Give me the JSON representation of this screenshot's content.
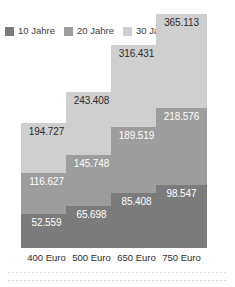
{
  "legend": {
    "items": [
      {
        "label": "10 Jahre",
        "color": "#7b7b7b"
      },
      {
        "label": "20 Jahre",
        "color": "#9d9d9d"
      },
      {
        "label": "30 Jahre",
        "color": "#cfcfcf"
      }
    ]
  },
  "chart_data": {
    "type": "bar",
    "stacked": true,
    "title": "",
    "subtitle": "",
    "xlabel": "",
    "ylabel": "",
    "grid": false,
    "legend_position": "top-left",
    "categories": [
      "400 Euro",
      "500 Euro",
      "650 Euro",
      "750 Euro"
    ],
    "series": [
      {
        "name": "10 Jahre",
        "color": "#7b7b7b",
        "values": [
          52559,
          65698,
          85408,
          98547
        ]
      },
      {
        "name": "20 Jahre",
        "color": "#9d9d9d",
        "values": [
          116627,
          145748,
          189519,
          218576
        ]
      },
      {
        "name": "30 Jahre",
        "color": "#cfcfcf",
        "values": [
          194727,
          243408,
          316431,
          365113
        ]
      }
    ],
    "value_labels": {
      "400 Euro": {
        "10 Jahre": "52.559",
        "20 Jahre": "116.627",
        "30 Jahre": "194.727"
      },
      "500 Euro": {
        "10 Jahre": "65.698",
        "20 Jahre": "145.748",
        "30 Jahre": "243.408"
      },
      "650 Euro": {
        "10 Jahre": "85.408",
        "20 Jahre": "189.519",
        "30 Jahre": "316.431"
      },
      "750 Euro": {
        "10 Jahre": "98.547",
        "20 Jahre": "218.576",
        "30 Jahre": "365.113"
      }
    },
    "cumulative_labels": true,
    "ylim": [
      0,
      365113
    ]
  },
  "bars": [
    {
      "category": "400 Euro",
      "top_label": "194.727",
      "mid_label": "116.627",
      "bottom_label": "52.559"
    },
    {
      "category": "500 Euro",
      "top_label": "243.408",
      "mid_label": "145.748",
      "bottom_label": "65.698"
    },
    {
      "category": "650 Euro",
      "top_label": "316.431",
      "mid_label": "189.519",
      "bottom_label": "85.408"
    },
    {
      "category": "750 Euro",
      "top_label": "365.113",
      "mid_label": "218.576",
      "bottom_label": "98.547"
    }
  ]
}
